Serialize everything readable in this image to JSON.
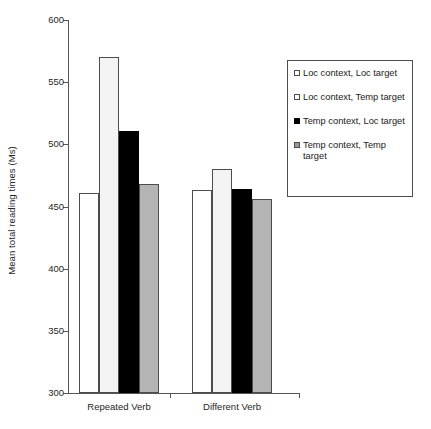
{
  "chart_data": {
    "type": "bar",
    "title": "",
    "subtitle": "",
    "xlabel": "",
    "ylabel": "Mean total reading times (Ms)",
    "categories": [
      "Repeated Verb",
      "Different Verb"
    ],
    "ylim": [
      300,
      600
    ],
    "ytick_step": 50,
    "yticks": [
      300,
      350,
      400,
      450,
      500,
      550,
      600
    ],
    "grid": false,
    "legend_position": "right",
    "series": [
      {
        "name": "Loc context, Loc target",
        "color": "#ffffff",
        "values": [
          461,
          463
        ]
      },
      {
        "name": "Loc context, Temp target",
        "color": "#f4f4f4",
        "values": [
          570,
          480
        ]
      },
      {
        "name": "Temp context, Loc target",
        "color": "#000000",
        "values": [
          511,
          464
        ]
      },
      {
        "name": "Temp context, Temp target",
        "color": "#b4b4b4",
        "values": [
          468,
          456
        ]
      }
    ]
  },
  "axes": {
    "y_title": "Mean total reading times (Ms)",
    "y_tick_labels": [
      "600",
      "550",
      "500",
      "450",
      "400",
      "350",
      "300"
    ],
    "x_tick_labels": [
      "Repeated Verb",
      "Different Verb"
    ]
  },
  "legend": {
    "entries": [
      {
        "label": "Loc context, Loc target",
        "swatch": "white-square-icon"
      },
      {
        "label": "Loc context, Temp target",
        "swatch": "light-square-icon"
      },
      {
        "label": "Temp context, Loc target",
        "swatch": "black-square-icon"
      },
      {
        "label": "Temp context, Temp target",
        "swatch": "gray-square-icon"
      }
    ]
  }
}
